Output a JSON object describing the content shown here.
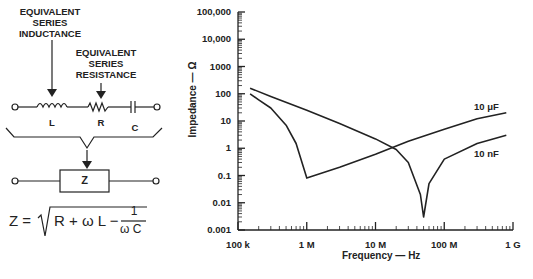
{
  "diagram": {
    "label_esl": [
      "EQUIVALENT",
      "SERIES",
      "INDUCTANCE"
    ],
    "label_esr": [
      "EQUIVALENT",
      "SERIES",
      "RESISTANCE"
    ],
    "component_L": "L",
    "component_R": "R",
    "component_C": "C",
    "box_label": "Z",
    "formula": {
      "lhs": "Z =",
      "radicand": "R + ω L −",
      "frac_num": "1",
      "frac_den": "ω C"
    }
  },
  "chart_data": {
    "type": "line",
    "title": "",
    "xlabel": "Frequency — Hz",
    "ylabel": "Impedance — Ω",
    "x_scale": "log",
    "y_scale": "log",
    "xlim": [
      100000,
      1000000000
    ],
    "ylim": [
      0.001,
      100000
    ],
    "x_tick_labels": [
      "100 k",
      "1 M",
      "10 M",
      "100 M",
      "1 G"
    ],
    "y_tick_labels": [
      "100,000",
      "10,000",
      "1000",
      "100",
      "10",
      "1",
      "0.1",
      "0.01",
      "0.001"
    ],
    "grid": false,
    "legend_position": "inline labels at right end of curves",
    "series": [
      {
        "name": "10 μF",
        "x": [
          150000,
          200000,
          300000,
          500000,
          700000,
          1000000,
          3000000,
          10000000,
          30000000,
          100000000,
          300000000,
          800000000
        ],
        "y": [
          100,
          60,
          30,
          7,
          1.5,
          0.08,
          0.2,
          0.6,
          1.8,
          5,
          12,
          20
        ]
      },
      {
        "name": "10 nF",
        "x": [
          150000,
          300000,
          1000000,
          3000000,
          10000000,
          20000000,
          30000000,
          45000000,
          50000000,
          60000000,
          100000000,
          300000000,
          800000000
        ],
        "y": [
          160,
          80,
          25,
          8,
          2.2,
          0.9,
          0.3,
          0.02,
          0.003,
          0.05,
          0.4,
          1.5,
          3
        ]
      }
    ],
    "annotations": [
      "10 μF",
      "10 nF"
    ]
  }
}
